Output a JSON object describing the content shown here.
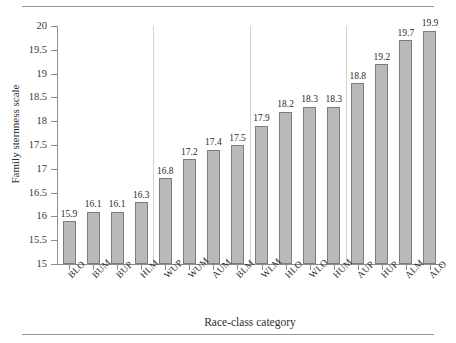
{
  "chart_data": {
    "type": "bar",
    "title": "",
    "xlabel": "Race-class category",
    "ylabel": "Family sternness scale",
    "ylim": [
      15,
      20
    ],
    "ytick_step": 0.5,
    "yticks": [
      "20",
      "19.5",
      "19",
      "18.5",
      "18",
      "17.5",
      "17",
      "16.5",
      "16",
      "15.5",
      "15"
    ],
    "grid": false,
    "legend": null,
    "categories": [
      "BLO",
      "BUM",
      "BUP",
      "HLM",
      "WUP",
      "WUM",
      "AUM",
      "BLM",
      "WLM",
      "HLO",
      "WLO",
      "HUM",
      "AUP",
      "HUP",
      "ALM",
      "ALO"
    ],
    "values": [
      15.9,
      16.1,
      16.1,
      16.3,
      16.8,
      17.2,
      17.4,
      17.5,
      17.9,
      18.2,
      18.3,
      18.3,
      18.8,
      19.2,
      19.7,
      19.9
    ],
    "value_labels": [
      "15.9",
      "16.1",
      "16.1",
      "16.3",
      "16.8",
      "17.2",
      "17.4",
      "17.5",
      "17.9",
      "18.2",
      "18.3",
      "18.3",
      "18.8",
      "19.2",
      "19.7",
      "19.9"
    ],
    "group_separators_after": [
      "HLM",
      "BLM",
      "HUM"
    ],
    "bar_color": "#b9b9b9",
    "bar_border_color": "#7d7d7d"
  }
}
